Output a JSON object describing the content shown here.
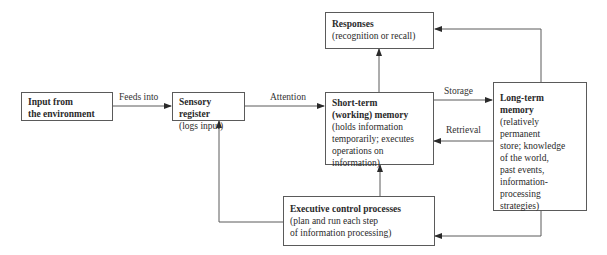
{
  "diagram": {
    "nodes": {
      "input": {
        "title": "Input from\nthe environment",
        "desc": ""
      },
      "sensory": {
        "title": "Sensory register",
        "desc": "(logs input)"
      },
      "responses": {
        "title": "Responses",
        "desc": "(recognition or recall)"
      },
      "stm": {
        "title": "Short-term\n(working) memory",
        "desc": "(holds information\ntemporarily; executes\noperations on\ninformation)"
      },
      "ltm": {
        "title": "Long-term\nmemory",
        "desc": "(relatively\npermanent\nstore; knowledge\nof the world,\npast events,\ninformation-\nprocessing\nstrategies)"
      },
      "exec": {
        "title": "Executive control processes",
        "desc": "(plan and run each step\nof information processing)"
      }
    },
    "edges": {
      "feeds_into": "Feeds into",
      "attention": "Attention",
      "storage": "Storage",
      "retrieval": "Retrieval"
    },
    "colors": {
      "line": "#5a5a5a",
      "text": "#2a2a2a",
      "background": "#ffffff"
    }
  }
}
